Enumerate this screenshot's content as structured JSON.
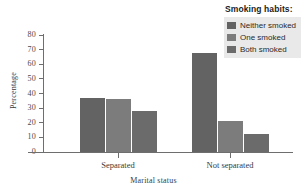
{
  "chart_data": {
    "type": "bar",
    "title": "",
    "xlabel": "Marital status",
    "ylabel": "Percentage",
    "categories": [
      "Separated",
      "Not separated"
    ],
    "series": [
      {
        "name": "Neither smoked",
        "values": [
          37,
          68
        ],
        "color": "#636363"
      },
      {
        "name": "One smoked",
        "values": [
          36,
          21
        ],
        "color": "#7c7c7c"
      },
      {
        "name": "Both smoked",
        "values": [
          28,
          12
        ],
        "color": "#6b6b6b"
      }
    ],
    "ylim": [
      0,
      80
    ],
    "yticks": [
      0,
      10,
      20,
      30,
      40,
      50,
      60,
      70,
      80
    ],
    "ytick_labels": [
      "0",
      "10",
      "20",
      "30",
      "40",
      "50",
      "60",
      "70",
      "80"
    ],
    "grid": false,
    "legend_position": "top-right",
    "legend_title": "Smoking habits:"
  },
  "legend": {
    "title": "Smoking habits:",
    "background": "#e9e9e9",
    "items": [
      {
        "label": "Neither smoked",
        "color": "#636363"
      },
      {
        "label": "One smoked",
        "color": "#7c7c7c"
      },
      {
        "label": "Both smoked",
        "color": "#6b6b6b"
      }
    ]
  },
  "axes": {
    "x_title": "Marital status",
    "y_title": "Percentage",
    "axis_color": "#6e6e6e"
  }
}
